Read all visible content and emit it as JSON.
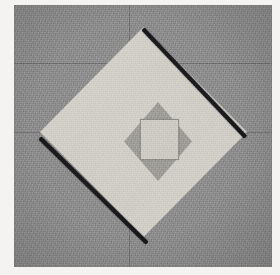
{
  "figure": {
    "title": "Nested diamond and square geometric figure",
    "medium": "scanned grayscale photograph",
    "canvas": {
      "width": 280,
      "height": 275,
      "paper_color": "#f4f3f1"
    },
    "plate": {
      "label": "outer square plate",
      "color": "#8e8e8e",
      "x": 14,
      "y": 5,
      "width": 258,
      "height": 262
    },
    "shapes": [
      {
        "name": "large-diamond",
        "kind": "diamond",
        "fill_color": "#cfcdc6",
        "center_x": 143,
        "center_y": 132,
        "half_width": 104,
        "half_height": 105,
        "vertices": "top (143,27)  right (247,137)  bottom (143,237)  left (40,137)"
      },
      {
        "name": "center-diamond",
        "kind": "diamond",
        "fill_color": "#9b9a95",
        "center_x": 144,
        "center_y": 137,
        "half_width": 34,
        "half_height": 40,
        "vertices": "top (144,97)  right (178,137)  bottom (144,176)  left (110,137)"
      },
      {
        "name": "inner-square",
        "kind": "square",
        "fill_color": "#cbc9c2",
        "x": 126,
        "y": 114,
        "width": 39,
        "height": 41,
        "outline_color": "#5a5a5a"
      }
    ],
    "shadow_edges": [
      {
        "name": "upper-right-shadow",
        "color": "#17181a",
        "from": "top vertex",
        "to": "right vertex"
      },
      {
        "name": "lower-left-shadow",
        "color": "#17181a",
        "from": "left vertex",
        "to": "bottom vertex"
      }
    ],
    "background_seams": [
      {
        "name": "seam-horizontal-upper",
        "orientation": "horizontal",
        "position": 63
      },
      {
        "name": "seam-horizontal-mid",
        "orientation": "horizontal",
        "position": 132
      },
      {
        "name": "seam-vertical-center",
        "orientation": "vertical",
        "position": 129
      }
    ],
    "palette": {
      "paper": "#f4f3f1",
      "background_gray": "#8e8e8e",
      "light_gray": "#cfcdc6",
      "mid_gray": "#9b9a95",
      "inner_gray": "#cbc9c2",
      "shadow_black": "#17181a"
    }
  }
}
